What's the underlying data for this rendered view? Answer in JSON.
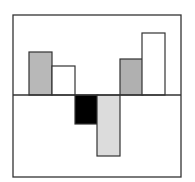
{
  "chart_data": {
    "type": "bar",
    "title": "",
    "xlabel": "",
    "ylabel": "",
    "categories": [
      "1",
      "2",
      "3",
      "4",
      "5",
      "6"
    ],
    "values": [
      43,
      29,
      -29,
      -61,
      36,
      62
    ],
    "colors": [
      "#b8b8b8",
      "#ffffff",
      "#000000",
      "#dcdcdc",
      "#b0b0b0",
      "#ffffff"
    ],
    "ylim": [
      -82,
      80
    ],
    "grid": false,
    "legend": null,
    "baseline": 0
  },
  "layout": {
    "frame": {
      "x": 13,
      "y": 15,
      "w": 168,
      "h": 162
    },
    "baseline_y": 95,
    "bar_x": [
      29,
      52,
      75,
      97,
      120,
      142
    ],
    "bar_w": 23,
    "stroke": "#333333"
  }
}
